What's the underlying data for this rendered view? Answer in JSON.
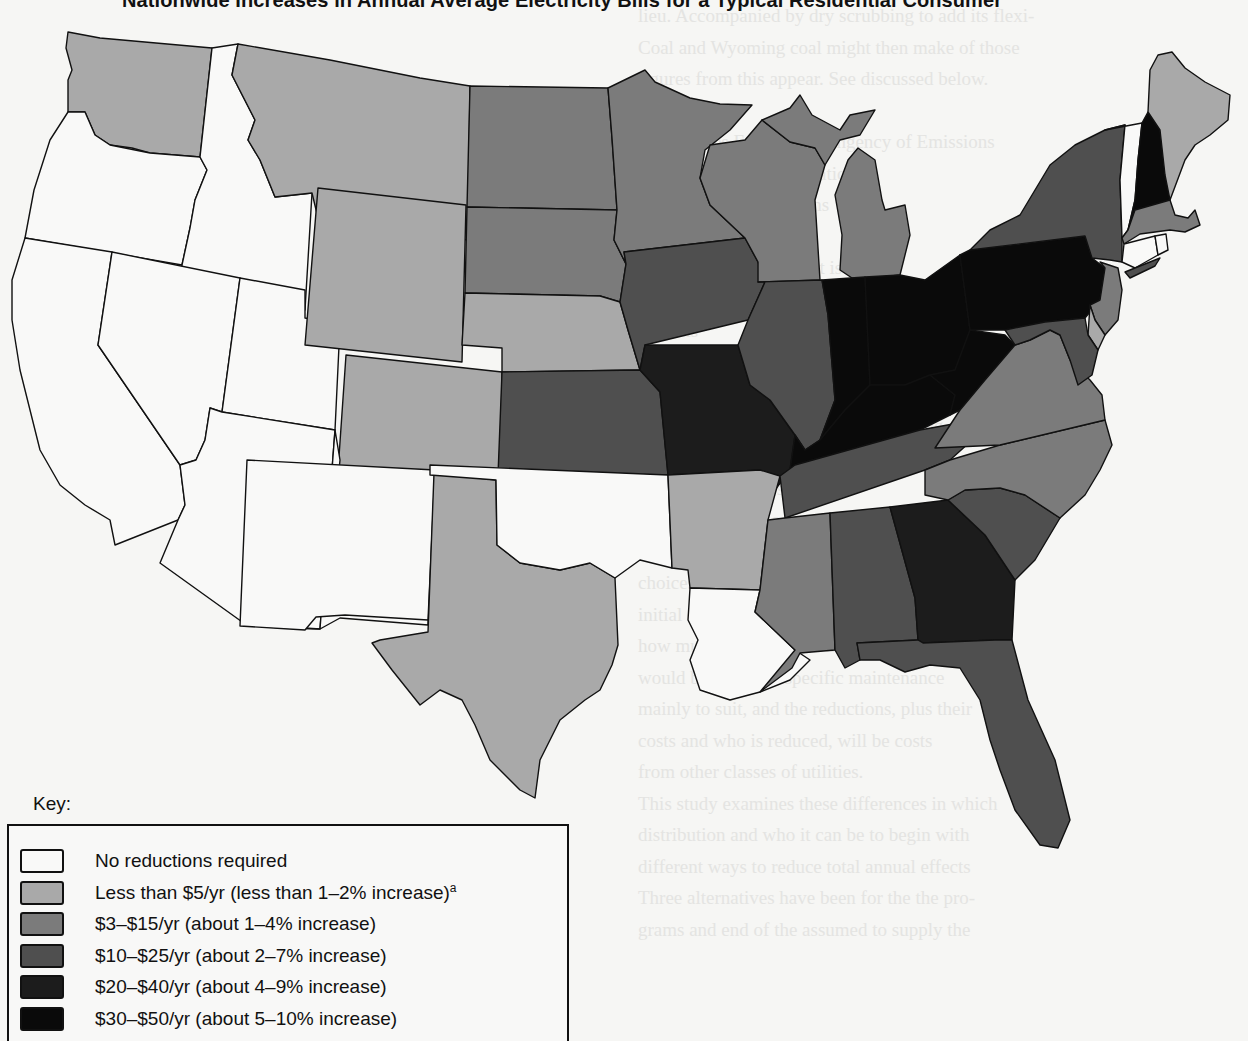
{
  "title": "Nationwide Increases in Annual Average Electricity Bills for a Typical Residential Consumer",
  "key": {
    "heading": "Key:",
    "tiers": [
      {
        "id": "t0",
        "label": "No reductions required",
        "footnote": "",
        "color": "#f9f9f8"
      },
      {
        "id": "t1",
        "label": "Less than $5/yr (less than 1–2% increase)",
        "footnote": "a",
        "color": "#a9a9a9"
      },
      {
        "id": "t2",
        "label": "$3–$15/yr (about 1–4% increase)",
        "footnote": "",
        "color": "#7b7b7b"
      },
      {
        "id": "t3",
        "label": "$10–$25/yr (about 2–7% increase)",
        "footnote": "",
        "color": "#4f4f4f"
      },
      {
        "id": "t4",
        "label": "$20–$40/yr (about 4–9% increase)",
        "footnote": "",
        "color": "#1c1c1c"
      },
      {
        "id": "t5",
        "label": "$30–$50/yr (about 5–10% increase)",
        "footnote": "",
        "color": "#0a0a0a"
      }
    ]
  },
  "states": {
    "WA": "t1",
    "OR": "t0",
    "CA": "t0",
    "ID": "t0",
    "NV": "t0",
    "UT": "t0",
    "AZ": "t0",
    "MT": "t1",
    "WY": "t1",
    "CO": "t1",
    "NM": "t0",
    "TX": "t1",
    "ND": "t2",
    "SD": "t2",
    "NE": "t1",
    "KS": "t3",
    "OK": "t0",
    "MN": "t2",
    "IA": "t3",
    "MO": "t4",
    "AR": "t1",
    "LA": "t0",
    "WI": "t2",
    "IL": "t3",
    "MI": "t2",
    "IN": "t5",
    "OH": "t5",
    "KY": "t5",
    "TN": "t3",
    "MS": "t2",
    "AL": "t3",
    "GA": "t4",
    "FL": "t3",
    "SC": "t3",
    "NC": "t2",
    "VA": "t2",
    "WV": "t5",
    "PA": "t5",
    "NY": "t3",
    "VT": "t0",
    "NH": "t5",
    "ME": "t1",
    "MA": "t2",
    "CT": "t0",
    "RI": "t0",
    "NJ": "t2",
    "DE": "t1",
    "MD": "t3"
  },
  "bleed_text": [
    "lieu. Accompanied by dry scrubbing to add its flexi-",
    "Coal and Wyoming coal might then make of those",
    "figures from this appear. See discussed below.",
    "",
    "Approaches Emission Stringency of Emissions",
    "from the Control Legislation",
    "Control Strategy Options",
    "Emissions",
    "   The basic control in cost is a Gift",
    "protected extensions of expanded emission",
    "systems",
    "programs and new rates after",
    "Congress with these regulations to require",
    "reductions for the required and resulting",
    "with the plants, and other of the states is",
    "the high areas rates",
    "   Adopting further control programs will",
    "require changes of the total decrease in",
    "choices. They include: the extent of the",
    "initial emissions, the terms on which to achieve",
    "how much, and on what time periods, during",
    "would be the more specific maintenance",
    "mainly to suit, and the reductions, plus their",
    "costs and who is reduced, will be costs",
    "from other classes of utilities.",
    "   This study examines these differences in which",
    "distribution and who it can be to begin with",
    "different ways to reduce total annual effects",
    "Three alternatives have been for the the pro-",
    "grams and end of the assumed to supply the"
  ]
}
